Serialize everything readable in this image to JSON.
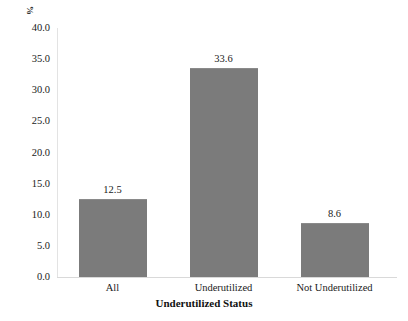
{
  "chart_data": {
    "type": "bar",
    "title": "",
    "subtitle": "",
    "xlabel": "Underutilized Status",
    "ylabel": "%",
    "categories": [
      "All",
      "Underutilized",
      "Not Underutilized"
    ],
    "values": [
      12.5,
      33.6,
      8.6
    ],
    "value_labels": [
      "12.5",
      "33.6",
      "8.6"
    ],
    "ylim": [
      0.0,
      40.0
    ],
    "ytick_step": 5.0,
    "ytick_labels": [
      "40.0",
      "35.0",
      "30.0",
      "25.0",
      "20.0",
      "15.0",
      "10.0",
      "5.0",
      "0.0"
    ],
    "ytick_values": [
      40.0,
      35.0,
      30.0,
      25.0,
      20.0,
      15.0,
      10.0,
      5.0,
      0.0
    ],
    "grid": false,
    "legend": null,
    "bar_color": "#7b7b7b",
    "axis_color": "#d9d9d9",
    "text_color": "#1a1a1a",
    "background": "#ffffff"
  }
}
